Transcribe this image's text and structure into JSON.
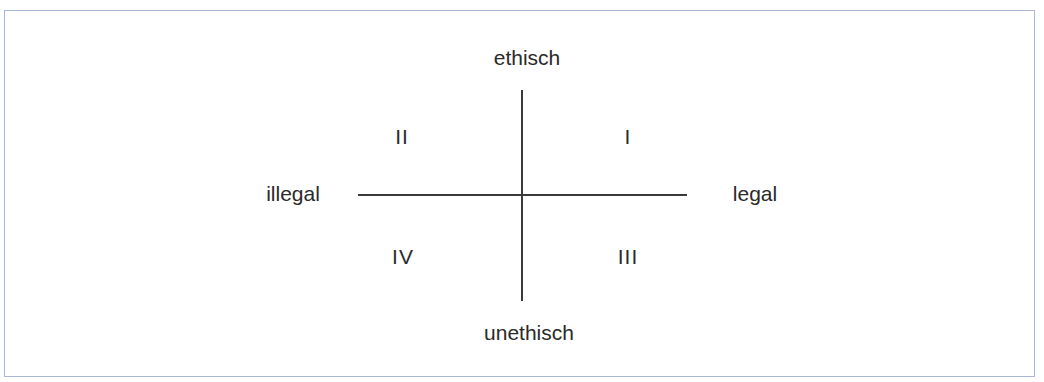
{
  "diagram": {
    "type": "quadrant",
    "axes": {
      "top": "ethisch",
      "bottom": "unethisch",
      "left": "illegal",
      "right": "legal"
    },
    "quadrants": {
      "top_right": "I",
      "top_left": "II",
      "bottom_right": "III",
      "bottom_left": "IV"
    },
    "colors": {
      "frame_border": "#a9b8d8",
      "lines": "#3a3a3a",
      "text": "#2a2a2a"
    }
  }
}
